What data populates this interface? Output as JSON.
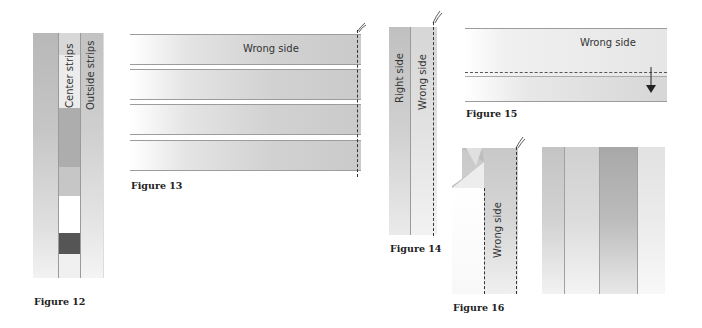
{
  "figures": {
    "fig12": {
      "caption": "Figure 12",
      "labels": {
        "center": "Center strips",
        "outside": "Outside strips"
      }
    },
    "fig13": {
      "caption": "Figure 13",
      "label": "Wrong side",
      "strip_count": 4
    },
    "fig14": {
      "caption": "Figure 14",
      "labels": {
        "right": "Right side",
        "wrong": "Wrong side"
      }
    },
    "fig15": {
      "caption": "Figure 15",
      "label": "Wrong side"
    },
    "fig16": {
      "caption": "Figure 16",
      "label": "Wrong side"
    }
  },
  "colors": {
    "stitch_line": "#333333",
    "strip_border": "#9c9c9c",
    "dark_block": "#555555"
  }
}
